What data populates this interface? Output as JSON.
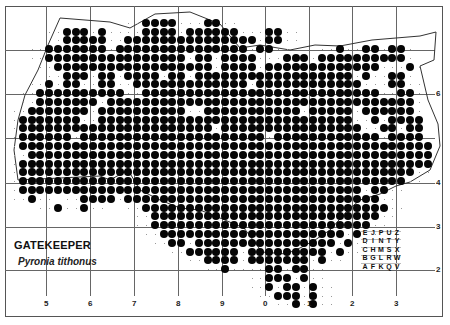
{
  "title": "GATEKEEPER",
  "species": "Pyronia tithonus",
  "axes": {
    "x_labels": [
      {
        "text": "5",
        "x": 46
      },
      {
        "text": "6",
        "x": 90
      },
      {
        "text": "7",
        "x": 134
      },
      {
        "text": "8",
        "x": 178
      },
      {
        "text": "9",
        "x": 222
      },
      {
        "text": "0",
        "x": 265
      },
      {
        "text": "1",
        "x": 309
      },
      {
        "text": "2",
        "x": 352
      },
      {
        "text": "3",
        "x": 396
      }
    ],
    "y_labels": [
      {
        "text": "6",
        "y": 94
      },
      {
        "text": "4",
        "y": 183
      },
      {
        "text": "3",
        "y": 227
      },
      {
        "text": "2",
        "y": 270
      }
    ]
  },
  "tetrad_key": {
    "rows": [
      [
        "E",
        "J",
        "P",
        "U",
        "Z"
      ],
      [
        "D",
        "I",
        "N",
        "T",
        "Y"
      ],
      [
        "C",
        "H",
        "M",
        "S",
        "X"
      ],
      [
        "B",
        "G",
        "L",
        "R",
        "W"
      ],
      [
        "A",
        "F",
        "K",
        "Q",
        "V"
      ]
    ]
  },
  "colors": {
    "dot": "#050505",
    "grid": "#666666",
    "frame": "#555555"
  },
  "dot_grid": {
    "origin_x": 14,
    "origin_y": 14,
    "step": 8.8,
    "rows": [
      "..............................................",
      "...............XXXX...XX.......................",
      "......XXX.X....XXXX.XXXXXX...XX................",
      "......XXXXX..XXXXXXXXXXXXXXX.XX...............",
      "....XXXXXXX.XXXXXXXXXXXXXXX.XX.......X..XX.XX.",
      "....XXXXXXXXXXXXXXXX.XX.XXXX...XXX.XXXXXXXXXX.",
      ".....XXXXXXXXXXXXXXXXXX.XXXX.XXXXXXXXXXXXX...X.",
      "......XXX.XX.XXXX.XX.XXXXXXXXXXXXXXXXXX.X..XX.",
      "....X.XX..XX..XXXXXXXXXXXXX.XXXXXXXXXXXX...XX..",
      "...XXXXXXXXXX..XXXXXXXXXXXXXXXXXXXXXXXXXXX..XX.",
      "...XXXXXXX.XXXXXXXXXXXXXXXXXXXXXXXXXXXXXXXXXXX.",
      "..XXXXXXX.XXXXXXXXXX..XXXXXXXXXXX.XXXXX.XXXXXX.",
      ".XXXXXXX..XXXXXXXXXXXXXXXXXXXXXXXXXXXXX..X.XXXX",
      ".XXXXXXXXXXXXXXXXXXXXXX.XXXXXXXXXXXXXXXX..XX.XX",
      ".XXXXXX.XXXXXXXXXXXXXXXXXXXXX.XXXXXXXXXXXX.XXXX",
      ".XXXXXXXXXXXXXXXXXXXXXXXXXXXXXXXXXXXXXXXXXXXXXXX",
      "..XXXXXXXXXXXXXXXXXXXXXXXXXXXXXXXXXXXXXXXXXXXXXX",
      ".XXXXXXXXXXXXXXXXXXXXXXXXXXXXXXXXXXXXXXXXXXXXXXX",
      ".XXXXXXXXXXXXXXXXXXXXXXXXXXXXXXXXXXXXXXXXXXXXX..",
      ".XXXXXXXXXXXXXXXXXXXXXXXXXXXXXXXXXXXXXXXXXXXX...",
      ".XXXXXXXXXXXXXXXXXXXXXXXXXXXXXXXXXXXXXXX.XX.....",
      "..X.....XXXX.XXXXXXXXXXXXXXXXXXXXXXXXXXXXX......",
      ".....X..X......XXXXXXXXXXXXXXXXXXXXXXXXXXXX.....",
      "................XXXXXXXXXXXXXXXXXXXXXXXXXX......",
      "................XXXXXXXXXXXXXXXXXXXXXXXXX.......",
      ".................XXXXXXXXXXXXXXXXXXXXX.X........",
      "..................XX.XXXXXXXXXXXXXXXX.X.........",
      "....................XXXXXX.XXXXXXXXX.X.........",
      "......................XXXX.XXXXXXX.X............",
      "........................X....XX.XX.............",
      ".............................XXX.X..............",
      ".............................X.XX.X.............",
      "..............................XXX.X.............",
      "................................X.X............."
    ]
  }
}
